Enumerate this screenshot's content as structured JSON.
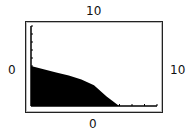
{
  "chart_data": {
    "type": "area",
    "title": "",
    "labels": {
      "top": "10",
      "left": "0",
      "right": "10",
      "bottom": "0"
    },
    "x": [
      0,
      1,
      2,
      3,
      4,
      5,
      6,
      7,
      8,
      9,
      10
    ],
    "values": [
      5.0,
      4.6,
      4.2,
      3.8,
      3.3,
      2.6,
      1.2,
      0,
      0,
      0,
      0
    ],
    "xlim": [
      0,
      10
    ],
    "ylim": [
      0,
      10
    ],
    "fill_color": "#000000",
    "y_ticks_count": 6,
    "x_ticks_count": 5
  }
}
